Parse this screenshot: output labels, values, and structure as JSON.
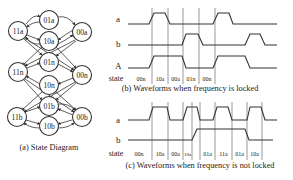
{
  "state_diagram": {
    "caption": "(a) State Diagram",
    "nodes": [
      {
        "id": "11a",
        "label": "11a",
        "x": 18,
        "y": 31
      },
      {
        "id": "01a",
        "label": "01a",
        "x": 49,
        "y": 20
      },
      {
        "id": "10a",
        "label": "10a",
        "x": 49,
        "y": 41
      },
      {
        "id": "00a",
        "label": "00a",
        "x": 82,
        "y": 32
      },
      {
        "id": "11n",
        "label": "11n",
        "x": 18,
        "y": 72
      },
      {
        "id": "01n",
        "label": "01n",
        "x": 49,
        "y": 62
      },
      {
        "id": "10n",
        "label": "10n",
        "x": 49,
        "y": 85
      },
      {
        "id": "00n",
        "label": "00n",
        "x": 82,
        "y": 75
      },
      {
        "id": "11b",
        "label": "11b",
        "x": 17,
        "y": 117
      },
      {
        "id": "01b",
        "label": "01b",
        "x": 49,
        "y": 106
      },
      {
        "id": "10b",
        "label": "10b",
        "x": 49,
        "y": 126
      },
      {
        "id": "00b",
        "label": "00b",
        "x": 82,
        "y": 117
      }
    ]
  },
  "waveforms_locked": {
    "caption": "(b) Waveforms when frequency is locked",
    "signal_labels": [
      "a",
      "b",
      "A"
    ],
    "state_label": "state",
    "states": [
      "00n",
      "10a",
      "00a",
      "01n",
      "00n"
    ]
  },
  "waveforms_not_locked": {
    "caption": "(c) Waveforms when frequency is not locked",
    "signal_labels": [
      "a",
      "b"
    ],
    "state_label": "state",
    "states": [
      "00n",
      "10a",
      "00a",
      "10a",
      "01a",
      "11a",
      "01a",
      "10a"
    ]
  }
}
